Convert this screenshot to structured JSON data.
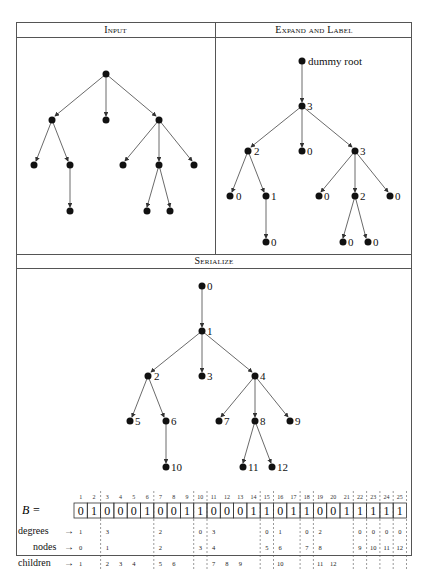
{
  "panels": {
    "input": {
      "title": "Input"
    },
    "expand": {
      "title": "Expand and Label",
      "dummy_label": "dummy root",
      "degree_labels": [
        "3",
        "2",
        "0",
        "3",
        "0",
        "1",
        "0",
        "2",
        "0",
        "0",
        "0",
        "0"
      ]
    },
    "serialize": {
      "title": "Serialize",
      "node_labels": [
        "0",
        "1",
        "2",
        "3",
        "4",
        "5",
        "6",
        "7",
        "8",
        "9",
        "10",
        "11",
        "12"
      ]
    }
  },
  "bitstring": {
    "label": "B =",
    "indices": [
      "1",
      "2",
      "3",
      "4",
      "5",
      "6",
      "7",
      "8",
      "9",
      "10",
      "11",
      "12",
      "13",
      "14",
      "15",
      "16",
      "17",
      "18",
      "19",
      "20",
      "21",
      "22",
      "23",
      "24",
      "25"
    ],
    "bits": [
      "0",
      "1",
      "0",
      "0",
      "0",
      "1",
      "0",
      "0",
      "1",
      "1",
      "0",
      "0",
      "0",
      "1",
      "1",
      "0",
      "1",
      "1",
      "0",
      "0",
      "1",
      "1",
      "1",
      "1",
      "1"
    ]
  },
  "rows": {
    "degrees": {
      "label": "degrees",
      "arrow": "→",
      "values": [
        [
          "1",
          "1"
        ],
        [
          "3",
          "3"
        ],
        [
          "2",
          "7"
        ],
        [
          "0",
          "10"
        ],
        [
          "3",
          "11"
        ],
        [
          "0",
          "15"
        ],
        [
          "1",
          "16"
        ],
        [
          "0",
          "18"
        ],
        [
          "2",
          "19"
        ],
        [
          "0",
          "22"
        ],
        [
          "0",
          "23"
        ],
        [
          "0",
          "24"
        ],
        [
          "0",
          "25"
        ]
      ]
    },
    "nodes": {
      "label": "nodes",
      "arrow": "→",
      "values": [
        [
          "0",
          "1"
        ],
        [
          "1",
          "3"
        ],
        [
          "2",
          "7"
        ],
        [
          "3",
          "10"
        ],
        [
          "4",
          "11"
        ],
        [
          "5",
          "15"
        ],
        [
          "6",
          "16"
        ],
        [
          "7",
          "18"
        ],
        [
          "8",
          "19"
        ],
        [
          "9",
          "22"
        ],
        [
          "10",
          "23"
        ],
        [
          "11",
          "24"
        ],
        [
          "12",
          "25"
        ]
      ]
    },
    "children": {
      "label": "children",
      "arrow": "→",
      "values": [
        [
          "1",
          "1"
        ],
        [
          "2",
          "3"
        ],
        [
          "3",
          "4"
        ],
        [
          "4",
          "5"
        ],
        [
          "5",
          "7"
        ],
        [
          "6",
          "8"
        ],
        [
          "7",
          "11"
        ],
        [
          "8",
          "12"
        ],
        [
          "9",
          "13"
        ],
        [
          "10",
          "16"
        ],
        [
          "11",
          "19"
        ],
        [
          "12",
          "20"
        ]
      ]
    }
  },
  "caption": {
    "text": ""
  }
}
